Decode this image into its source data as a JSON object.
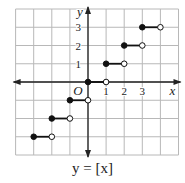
{
  "caption": "y = [x]",
  "axes": {
    "x_label": "x",
    "y_label": "y",
    "origin_label": "O",
    "x_ticks": [
      "1",
      "2",
      "3"
    ],
    "y_ticks": [
      "1",
      "2",
      "3"
    ]
  },
  "colors": {
    "grid": "#b8b8b8",
    "axis": "#222222",
    "segment": "#111111"
  },
  "chart_data": {
    "type": "line",
    "title": "y = [x]",
    "subtitle": "greatest integer (floor) step function",
    "xlabel": "x",
    "ylabel": "y",
    "xlim": [
      -4,
      5
    ],
    "ylim": [
      -4,
      4
    ],
    "grid": true,
    "x_tick_labels": [
      1,
      2,
      3
    ],
    "y_tick_labels": [
      1,
      2,
      3
    ],
    "origin_label": "O",
    "series": [
      {
        "name": "y = [x]",
        "segments": [
          {
            "x_start": -3,
            "x_end": -2,
            "y": -3,
            "start_closed": true,
            "end_closed": false
          },
          {
            "x_start": -2,
            "x_end": -1,
            "y": -2,
            "start_closed": true,
            "end_closed": false
          },
          {
            "x_start": -1,
            "x_end": 0,
            "y": -1,
            "start_closed": true,
            "end_closed": false
          },
          {
            "x_start": 0,
            "x_end": 1,
            "y": 0,
            "start_closed": true,
            "end_closed": false
          },
          {
            "x_start": 1,
            "x_end": 2,
            "y": 1,
            "start_closed": true,
            "end_closed": false
          },
          {
            "x_start": 2,
            "x_end": 3,
            "y": 2,
            "start_closed": true,
            "end_closed": false
          },
          {
            "x_start": 3,
            "x_end": 4,
            "y": 3,
            "start_closed": true,
            "end_closed": false
          }
        ]
      }
    ]
  }
}
